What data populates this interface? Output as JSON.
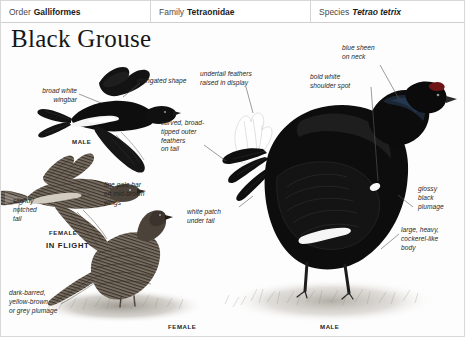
{
  "taxonomy": {
    "order_label": "Order",
    "order_value": "Galliformes",
    "family_label": "Family",
    "family_value": "Tetraonidae",
    "species_label": "Species",
    "species_value": "Tetrao tetrix"
  },
  "title": "Black Grouse",
  "annotations": [
    {
      "id": "broad-white-wingbar",
      "text": "broad white\nwingbar"
    },
    {
      "id": "elongated-shape",
      "text": "elongated shape"
    },
    {
      "id": "undertail-feathers",
      "text": "undertail feathers\nraised in display"
    },
    {
      "id": "blue-sheen-neck",
      "text": "blue sheen\non neck"
    },
    {
      "id": "bold-white-shoulder",
      "text": "bold white\nshoulder spot"
    },
    {
      "id": "curved-outer-feathers",
      "text": "curved, broad-\ntipped outer\nfeathers\non tail"
    },
    {
      "id": "fine-pale-bar",
      "text": "fine pale bar\non mid-brown\nwings"
    },
    {
      "id": "slightly-notched-tail",
      "text": "slightly\nnotched\ntail"
    },
    {
      "id": "white-patch-under-tail",
      "text": "white patch\nunder tail"
    },
    {
      "id": "glossy-black-plumage",
      "text": "glossy\nblack\nplumage"
    },
    {
      "id": "large-heavy-body",
      "text": "large, heavy,\ncockerel-like\nbody"
    },
    {
      "id": "dark-barred-plumage",
      "text": "dark-barred,\nyellow-brown\nor grey plumage"
    }
  ],
  "captions": [
    {
      "id": "male-flight",
      "text": "MALE"
    },
    {
      "id": "female-flight",
      "text": "FEMALE"
    },
    {
      "id": "in-flight",
      "text": "IN FLIGHT"
    },
    {
      "id": "female-ground",
      "text": "FEMALE"
    },
    {
      "id": "male-ground",
      "text": "MALE"
    }
  ],
  "colors": {
    "plate_background": "#fdfdfd",
    "header_background": "#ffffff",
    "header_divider": "#d5d5d5",
    "text": "#272727",
    "male_plumage": "#111111",
    "female_plumage": "#6d6257",
    "ground": "#9a958c",
    "leader_line": "#555555"
  }
}
